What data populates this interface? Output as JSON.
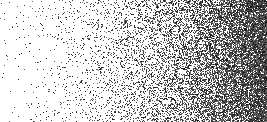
{
  "image": {
    "description": "stippled gradient, sparse dots on left to dense dots on right",
    "width": 267,
    "height": 122,
    "background": "#ffffff",
    "dot_color": "#111111",
    "density_start": 0.01,
    "density_end": 0.95,
    "density_curve": 2.2,
    "dot_size": 1,
    "seed": 12345
  }
}
